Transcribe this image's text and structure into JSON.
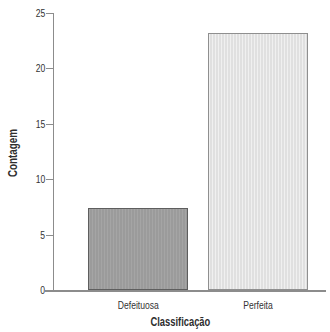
{
  "chart_data": {
    "type": "bar",
    "title": "",
    "categories": [
      "Defeituosa",
      "Perfeita"
    ],
    "values": [
      7.4,
      23.2
    ],
    "xlabel": "Classificação",
    "ylabel": "Contagem",
    "ylim": [
      0,
      25
    ],
    "y_ticks": [
      0,
      5,
      10,
      15,
      20,
      25
    ],
    "grid": "off",
    "legend": "none",
    "background_color": "#ffffff",
    "bar_colors": [
      "#9b9b9b",
      "#e4e4e4"
    ],
    "bar_border_colors": [
      "#5e5e5e",
      "#8f8f8f"
    ],
    "axis_color": "#8c8c8c",
    "text_color": "#333333"
  }
}
